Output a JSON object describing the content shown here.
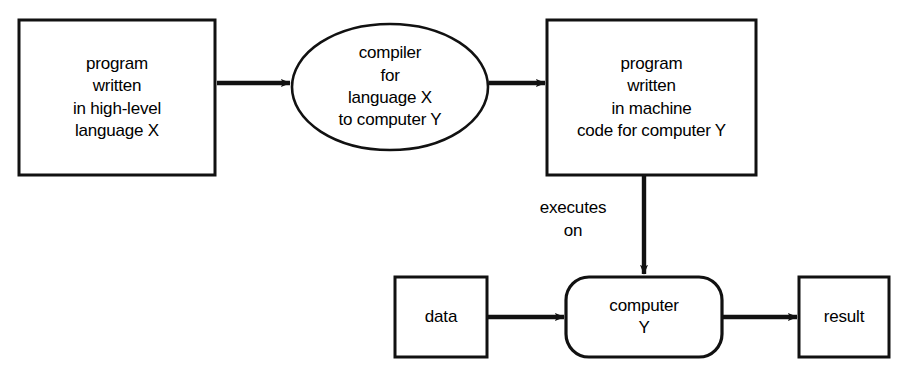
{
  "diagram": {
    "stroke_color": "#111111",
    "fill_color": "#ffffff",
    "background_color": "#ffffff",
    "nodes": [
      {
        "id": "source-program",
        "shape": "rectangle",
        "lines": [
          "program",
          "written",
          "in high-level",
          "language X"
        ]
      },
      {
        "id": "compiler",
        "shape": "ellipse",
        "lines": [
          "compiler",
          "for",
          "language X",
          "to computer Y"
        ]
      },
      {
        "id": "machine-program",
        "shape": "rectangle",
        "lines": [
          "program",
          "written",
          "in machine",
          "code for computer Y"
        ]
      },
      {
        "id": "data",
        "shape": "rectangle",
        "lines": [
          "data"
        ]
      },
      {
        "id": "computer",
        "shape": "rounded-rectangle",
        "lines": [
          "computer",
          "Y"
        ]
      },
      {
        "id": "result",
        "shape": "rectangle",
        "lines": [
          "result"
        ]
      }
    ],
    "edges": [
      {
        "id": "source-to-compiler",
        "from": "source-program",
        "to": "compiler",
        "label": ""
      },
      {
        "id": "compiler-to-machine",
        "from": "compiler",
        "to": "machine-program",
        "label": ""
      },
      {
        "id": "machine-to-computer",
        "from": "machine-program",
        "to": "computer",
        "label_lines": [
          "executes",
          "on"
        ]
      },
      {
        "id": "data-to-computer",
        "from": "data",
        "to": "computer",
        "label": ""
      },
      {
        "id": "computer-to-result",
        "from": "computer",
        "to": "result",
        "label": ""
      }
    ]
  }
}
